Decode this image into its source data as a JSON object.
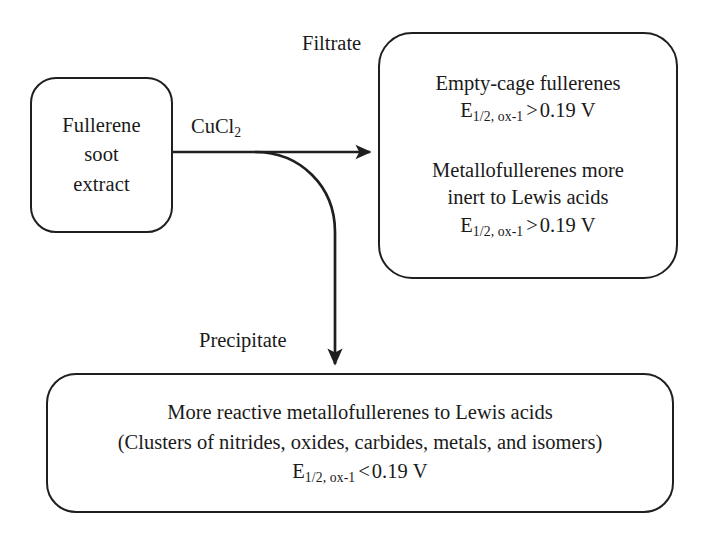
{
  "diagram": {
    "stroke_color": "#1f1f1f",
    "background_color": "#ffffff",
    "nodes": {
      "source": {
        "lines": [
          "Fullerene",
          "soot",
          "extract"
        ]
      },
      "filtrate": {
        "group_1": {
          "text": "Empty-cage fullerenes",
          "potential": {
            "symbol": "E",
            "subscript": "1/2, ox-1",
            "relation": ">",
            "value": "0.19",
            "unit": "V"
          }
        },
        "group_2": {
          "line_1": "Metallofullerenes more",
          "line_2": "inert to Lewis acids",
          "potential": {
            "symbol": "E",
            "subscript": "1/2, ox-1",
            "relation": ">",
            "value": "0.19",
            "unit": "V"
          }
        }
      },
      "precipitate": {
        "line_1": "More reactive metallofullerenes to Lewis acids",
        "line_2": "(Clusters of nitrides, oxides, carbides, metals, and isomers)",
        "potential": {
          "symbol": "E",
          "subscript": "1/2, ox-1",
          "relation": "<",
          "value": "0.19",
          "unit": "V"
        }
      }
    },
    "edges": {
      "reagent_label": {
        "formula": "CuCl",
        "subscript": "2"
      },
      "filtrate_label": "Filtrate",
      "precipitate_label": "Precipitate"
    }
  }
}
